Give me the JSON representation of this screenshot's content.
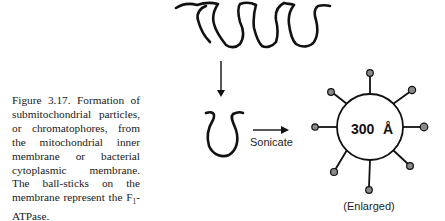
{
  "figure": {
    "number": "Figure 3.17.",
    "caption_pre": " Formation of submitochondrial particles, or chromatophores, from the mitochondrial inner membrane or bacterial cytoplasmic membrane. The ball-sticks on the membrane represent the F",
    "caption_sub": "1",
    "caption_post": "-ATPase.",
    "arrow_label": "Sonicate",
    "particle_size_label": "300",
    "particle_unit_label": "Å",
    "enlarged_label": "(Enlarged)"
  },
  "colors": {
    "ink": "#111111",
    "ball_fill": "#8a8a8a",
    "text": "#1a1a1a"
  }
}
